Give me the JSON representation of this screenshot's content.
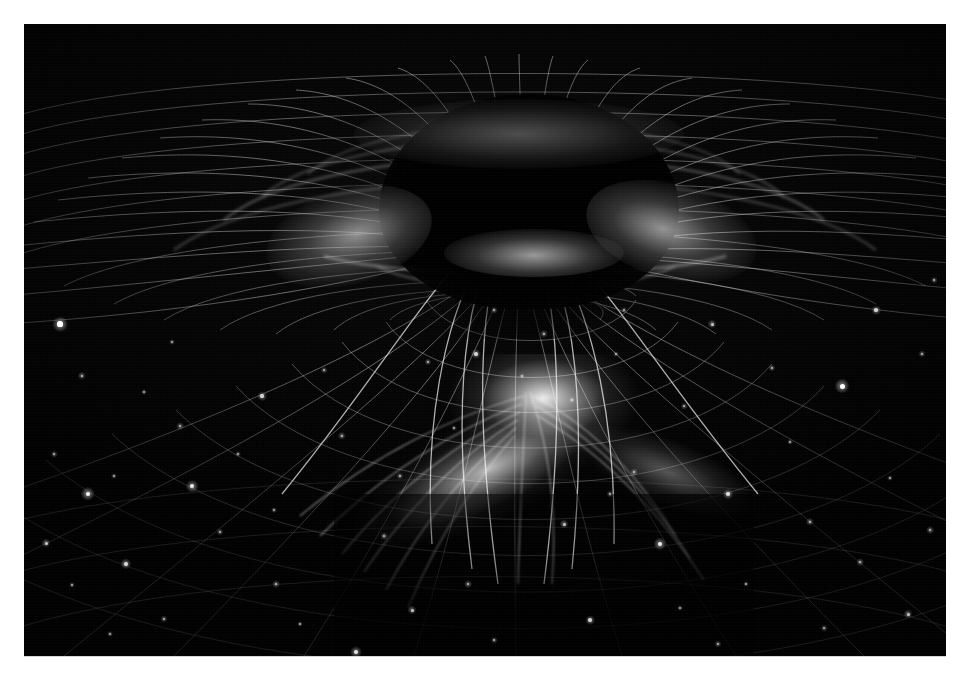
{
  "image": {
    "title": "Gravitational Well Spacetime Funnel",
    "subject": "black-hole-spacetime-curvature",
    "alt_text": "Monochrome astronomical visualization of a deep gravitational funnel warping a spacetime grid, with a bright nebula and star field below",
    "palette": {
      "background": "#ffffff",
      "space": "#000000",
      "grid_line": "#c8c8c8",
      "caustic_highlight": "#ffffff",
      "nebula": "#f2f2f2",
      "void": "#000000"
    },
    "frame": {
      "mat_color": "#ffffff",
      "mat_width_px": 24,
      "plate_width_px": 922,
      "plate_height_px": 632
    }
  },
  "scene": {
    "void": {
      "label": "event-horizon-void",
      "center_x": 505,
      "center_y": 178,
      "width": 300,
      "height": 215
    },
    "throat": {
      "label": "funnel-throat",
      "center_x": 505,
      "center_y": 232,
      "width": 160
    },
    "nebula": {
      "label": "emission-nebula",
      "center_x": 490,
      "center_y": 400
    },
    "caustics": [
      {
        "name": "caustic-left",
        "x": 320,
        "y": 212
      },
      {
        "name": "caustic-right",
        "x": 648,
        "y": 208
      },
      {
        "name": "caustic-top",
        "x": 495,
        "y": 110
      },
      {
        "name": "caustic-throat",
        "x": 510,
        "y": 229
      }
    ]
  },
  "grid": {
    "radial_count": 48,
    "ring_count": 22,
    "line_color": "#c9c9c9",
    "horizon_y": 300,
    "vanishing_x": 505
  },
  "chart_data": {
    "type": "scatter",
    "xlabel": "",
    "ylabel": "",
    "grid": true,
    "legend": "none",
    "stars": [
      {
        "x": 36,
        "y": 300,
        "r": 2.6
      },
      {
        "x": 58,
        "y": 352,
        "r": 1.4
      },
      {
        "x": 30,
        "y": 430,
        "r": 1.1
      },
      {
        "x": 64,
        "y": 470,
        "r": 2.4
      },
      {
        "x": 90,
        "y": 452,
        "r": 1.0
      },
      {
        "x": 22,
        "y": 519,
        "r": 1.5
      },
      {
        "x": 48,
        "y": 561,
        "r": 1.0
      },
      {
        "x": 102,
        "y": 540,
        "r": 1.9
      },
      {
        "x": 140,
        "y": 595,
        "r": 1.2
      },
      {
        "x": 86,
        "y": 610,
        "r": 1.0
      },
      {
        "x": 120,
        "y": 368,
        "r": 1.0
      },
      {
        "x": 156,
        "y": 402,
        "r": 1.3
      },
      {
        "x": 168,
        "y": 462,
        "r": 2.1
      },
      {
        "x": 196,
        "y": 508,
        "r": 1.2
      },
      {
        "x": 214,
        "y": 430,
        "r": 1.0
      },
      {
        "x": 238,
        "y": 372,
        "r": 1.6
      },
      {
        "x": 252,
        "y": 560,
        "r": 1.3
      },
      {
        "x": 276,
        "y": 600,
        "r": 1.0
      },
      {
        "x": 300,
        "y": 346,
        "r": 1.1
      },
      {
        "x": 318,
        "y": 412,
        "r": 1.4
      },
      {
        "x": 332,
        "y": 628,
        "r": 2.0
      },
      {
        "x": 360,
        "y": 512,
        "r": 1.3
      },
      {
        "x": 388,
        "y": 586,
        "r": 1.5
      },
      {
        "x": 404,
        "y": 338,
        "r": 1.2
      },
      {
        "x": 430,
        "y": 404,
        "r": 1.0
      },
      {
        "x": 452,
        "y": 330,
        "r": 1.7
      },
      {
        "x": 470,
        "y": 616,
        "r": 1.1
      },
      {
        "x": 498,
        "y": 352,
        "r": 1.0
      },
      {
        "x": 520,
        "y": 310,
        "r": 1.4
      },
      {
        "x": 548,
        "y": 376,
        "r": 1.2
      },
      {
        "x": 566,
        "y": 596,
        "r": 1.6
      },
      {
        "x": 592,
        "y": 330,
        "r": 1.0
      },
      {
        "x": 610,
        "y": 448,
        "r": 1.3
      },
      {
        "x": 636,
        "y": 520,
        "r": 2.2
      },
      {
        "x": 660,
        "y": 382,
        "r": 1.1
      },
      {
        "x": 688,
        "y": 300,
        "r": 1.5
      },
      {
        "x": 704,
        "y": 470,
        "r": 1.8
      },
      {
        "x": 722,
        "y": 560,
        "r": 1.0
      },
      {
        "x": 748,
        "y": 344,
        "r": 1.2
      },
      {
        "x": 766,
        "y": 418,
        "r": 1.0
      },
      {
        "x": 786,
        "y": 498,
        "r": 1.4
      },
      {
        "x": 800,
        "y": 604,
        "r": 1.1
      },
      {
        "x": 818,
        "y": 362,
        "r": 2.5
      },
      {
        "x": 836,
        "y": 538,
        "r": 1.3
      },
      {
        "x": 852,
        "y": 286,
        "r": 1.6
      },
      {
        "x": 866,
        "y": 454,
        "r": 1.0
      },
      {
        "x": 884,
        "y": 590,
        "r": 1.5
      },
      {
        "x": 898,
        "y": 330,
        "r": 1.2
      },
      {
        "x": 600,
        "y": 286,
        "r": 1.0
      },
      {
        "x": 470,
        "y": 286,
        "r": 1.1
      },
      {
        "x": 250,
        "y": 486,
        "r": 1.0
      },
      {
        "x": 376,
        "y": 452,
        "r": 1.2
      },
      {
        "x": 906,
        "y": 506,
        "r": 1.3
      },
      {
        "x": 910,
        "y": 256,
        "r": 1.1
      },
      {
        "x": 148,
        "y": 318,
        "r": 1.0
      },
      {
        "x": 694,
        "y": 620,
        "r": 1.2
      },
      {
        "x": 540,
        "y": 500,
        "r": 1.5
      },
      {
        "x": 586,
        "y": 470,
        "r": 1.2
      },
      {
        "x": 656,
        "y": 584,
        "r": 1.0
      },
      {
        "x": 444,
        "y": 560,
        "r": 1.3
      }
    ]
  }
}
